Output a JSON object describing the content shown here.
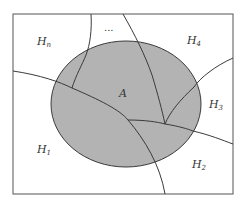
{
  "diagram": {
    "type": "venn-partition",
    "colors": {
      "background": "#ffffff",
      "frame": "#555555",
      "event_fill": "#b3b3b3",
      "lines": "#3a3a3a",
      "text": "#333333"
    },
    "event": {
      "label": "A"
    },
    "partitions": [
      {
        "base": "H",
        "sub": "1"
      },
      {
        "base": "H",
        "sub": "2"
      },
      {
        "base": "H",
        "sub": "3"
      },
      {
        "base": "H",
        "sub": "4"
      },
      {
        "base": "H",
        "sub": "n"
      }
    ],
    "ellipsis": "..."
  }
}
